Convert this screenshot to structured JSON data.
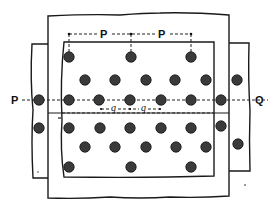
{
  "figure": {
    "labels": {
      "pitch_p_left": "P",
      "pitch_p_right": "P",
      "section_start": "P",
      "section_end": "Q",
      "diagonal_pitch_left": "q",
      "diagonal_pitch_right": "q"
    },
    "colors": {
      "line": "#1a1a1a",
      "rivet": "#3a3a3a",
      "background": "#ffffff"
    }
  },
  "plates": [
    {
      "name": "main-back-plate",
      "x": 48,
      "y": 14,
      "w": 182,
      "h": 184
    },
    {
      "name": "left-strip-plate",
      "x": 32,
      "y": 43,
      "w": 16,
      "h": 135
    },
    {
      "name": "right-strip-plate",
      "x": 230,
      "y": 43,
      "w": 19,
      "h": 128
    },
    {
      "name": "cover-plate",
      "x": 62,
      "y": 42,
      "w": 153,
      "h": 136
    }
  ],
  "rivets": [
    {
      "x": 69,
      "y": 57
    },
    {
      "x": 131,
      "y": 57
    },
    {
      "x": 191,
      "y": 57
    },
    {
      "x": 85,
      "y": 80
    },
    {
      "x": 115,
      "y": 80
    },
    {
      "x": 146,
      "y": 80
    },
    {
      "x": 175,
      "y": 80
    },
    {
      "x": 206,
      "y": 80
    },
    {
      "x": 237,
      "y": 80
    },
    {
      "x": 39,
      "y": 100
    },
    {
      "x": 69,
      "y": 100
    },
    {
      "x": 99,
      "y": 100
    },
    {
      "x": 130,
      "y": 100
    },
    {
      "x": 161,
      "y": 100
    },
    {
      "x": 191,
      "y": 100
    },
    {
      "x": 221,
      "y": 100
    },
    {
      "x": 39,
      "y": 128
    },
    {
      "x": 69,
      "y": 128
    },
    {
      "x": 100,
      "y": 128
    },
    {
      "x": 130,
      "y": 128
    },
    {
      "x": 161,
      "y": 128
    },
    {
      "x": 191,
      "y": 128
    },
    {
      "x": 221,
      "y": 126
    },
    {
      "x": 85,
      "y": 147
    },
    {
      "x": 115,
      "y": 147
    },
    {
      "x": 146,
      "y": 147
    },
    {
      "x": 176,
      "y": 147
    },
    {
      "x": 206,
      "y": 147
    },
    {
      "x": 238,
      "y": 144
    },
    {
      "x": 69,
      "y": 167
    },
    {
      "x": 131,
      "y": 167
    },
    {
      "x": 191,
      "y": 167
    }
  ]
}
